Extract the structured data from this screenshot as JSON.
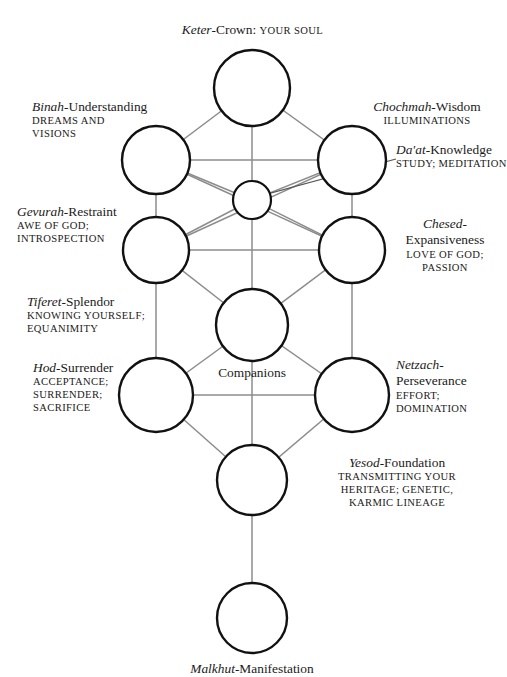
{
  "diagram": {
    "colors": {
      "background": "#ffffff",
      "text": "#1a1a1a",
      "circle_stroke": "#111111",
      "connector_line": "#8c8c8c",
      "pointer_line": "#555555"
    },
    "center_label": "Companions",
    "sephirot": [
      {
        "id": "keter",
        "hebrew": "Keter",
        "dash": "-",
        "english": "Crown",
        "suffix": ": ",
        "attributes": [
          "YOUR SOUL"
        ],
        "label_text": "Keter-Crown: YOUR SOUL",
        "inline": true
      },
      {
        "id": "binah",
        "hebrew": "Binah",
        "dash": "-",
        "english": "Understanding",
        "attributes": [
          "DREAMS AND",
          "VISIONS"
        ]
      },
      {
        "id": "chochmah",
        "hebrew": "Chochmah",
        "dash": "-",
        "english": "Wisdom",
        "attributes": [
          "ILLUMINATIONS"
        ]
      },
      {
        "id": "daat",
        "hebrew": "Da'at",
        "dash": "-",
        "english": "Knowledge",
        "attributes": [
          "STUDY; MEDITATION"
        ]
      },
      {
        "id": "gevurah",
        "hebrew": "Gevurah",
        "dash": "-",
        "english": "Restraint",
        "attributes": [
          "AWE OF GOD;",
          "INTROSPECTION"
        ]
      },
      {
        "id": "chesed",
        "hebrew": "Chesed",
        "dash": "-",
        "english": "Expansiveness",
        "attributes": [
          "LOVE OF GOD;",
          "PASSION"
        ]
      },
      {
        "id": "tiferet",
        "hebrew": "Tiferet",
        "dash": "-",
        "english": "Splendor",
        "attributes": [
          "KNOWING YOURSELF;",
          "EQUANIMITY"
        ]
      },
      {
        "id": "hod",
        "hebrew": "Hod",
        "dash": "-",
        "english": "Surrender",
        "attributes": [
          "ACCEPTANCE;",
          "SURRENDER;",
          "SACRIFICE"
        ]
      },
      {
        "id": "netzach",
        "hebrew": "Netzach",
        "dash": "-",
        "english": "Perseverance",
        "attributes": [
          "EFFORT;",
          "DOMINATION"
        ]
      },
      {
        "id": "yesod",
        "hebrew": "Yesod",
        "dash": "-",
        "english": "Foundation",
        "attributes": [
          "TRANSMITTING YOUR",
          "HERITAGE; GENETIC,",
          "KARMIC LINEAGE"
        ]
      },
      {
        "id": "malkhut",
        "hebrew": "Malkhut",
        "dash": "-",
        "english": "Manifestation",
        "attributes": []
      }
    ],
    "labels": {
      "keter": {
        "hebrew": "Keter",
        "dash": "-",
        "english": "Crown",
        "colon": ":",
        "attr": "YOUR SOUL"
      },
      "binah": {
        "term_heb": "Binah",
        "term_dash": "-",
        "term_eng": "Understanding",
        "a1": "DREAMS AND",
        "a2": "VISIONS"
      },
      "chochmah": {
        "term_heb": "Chochmah",
        "term_dash": "-",
        "term_eng": "Wisdom",
        "a1": "ILLUMINATIONS"
      },
      "daat": {
        "term_heb": "Da'at",
        "term_dash": "-",
        "term_eng": "Knowledge",
        "a1": "STUDY; MEDITATION"
      },
      "gevurah": {
        "term_heb": "Gevurah",
        "term_dash": "-",
        "term_eng": "Restraint",
        "a1": "AWE OF GOD;",
        "a2": "INTROSPECTION"
      },
      "chesed": {
        "term_heb": "Chesed",
        "term_dash": "-",
        "term_eng": "Expansiveness",
        "a1": "LOVE OF GOD;",
        "a2": "PASSION"
      },
      "tiferet": {
        "term_heb": "Tiferet",
        "term_dash": "-",
        "term_eng": "Splendor",
        "a1": "KNOWING YOURSELF;",
        "a2": "EQUANIMITY"
      },
      "hod": {
        "term_heb": "Hod",
        "term_dash": "-",
        "term_eng": "Surrender",
        "a1": "ACCEPTANCE;",
        "a2": "SURRENDER;",
        "a3": "SACRIFICE"
      },
      "netzach": {
        "term_heb": "Netzach",
        "term_dash": "-",
        "term_eng": "Perseverance",
        "a1": "EFFORT;",
        "a2": "DOMINATION"
      },
      "yesod": {
        "term_heb": "Yesod",
        "term_dash": "-",
        "term_eng": "Foundation",
        "a1": "TRANSMITTING YOUR",
        "a2": "HERITAGE; GENETIC,",
        "a3": "KARMIC LINEAGE"
      },
      "malkhut": {
        "term_heb": "Malkhut",
        "term_dash": "-",
        "term_eng": "Manifestation"
      },
      "companions": "Companions"
    }
  }
}
